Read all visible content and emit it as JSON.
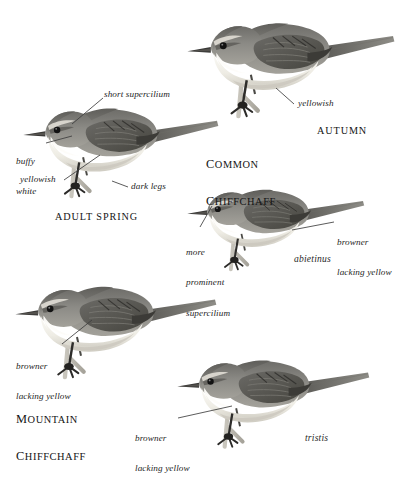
{
  "plate": {
    "kind": "bird-identification-plate",
    "background_color": "#ffffff",
    "ink_color": "#1e1e1e",
    "species_titles": [
      {
        "id": "common-chiffchaff",
        "line1": "Common",
        "line2": "Chiffchaff"
      },
      {
        "id": "mountain-chiffchaff",
        "line1": "Mountain",
        "line2": "Chiffchaff"
      }
    ],
    "plumage_titles": [
      {
        "id": "adult-spring",
        "text": "ADULT SPRING"
      },
      {
        "id": "autumn",
        "text": "AUTUMN"
      }
    ],
    "subspecies": [
      {
        "id": "abietinus",
        "text": "abietinus"
      },
      {
        "id": "tristis",
        "text": "tristis"
      }
    ],
    "figures": [
      {
        "id": "autumn-bird",
        "caption": "AUTUMN",
        "annotations": [
          {
            "id": "yellowish",
            "text": "yellowish"
          }
        ]
      },
      {
        "id": "adult-spring-bird",
        "caption": "ADULT SPRING",
        "annotations": [
          {
            "id": "short-supercilium",
            "text": "short supercilium"
          },
          {
            "id": "buffy-white",
            "text": "buffy\nwhite"
          },
          {
            "id": "yellowish",
            "text": "yellowish"
          },
          {
            "id": "dark-legs",
            "text": "dark legs"
          }
        ]
      },
      {
        "id": "abietinus-bird",
        "caption": "abietinus",
        "annotations": [
          {
            "id": "more-prominent-supercilium",
            "text": "more\nprominent\nsupercilium"
          },
          {
            "id": "browner-lacking-yellow",
            "text": "browner\nlacking yellow"
          }
        ]
      },
      {
        "id": "mountain-chiffchaff-bird",
        "caption": "MOUNTAIN CHIFFCHAFF",
        "annotations": [
          {
            "id": "browner-lacking-yellow",
            "text": "browner\nlacking yellow"
          }
        ]
      },
      {
        "id": "tristis-bird",
        "caption": "tristis",
        "annotations": [
          {
            "id": "browner-lacking-yellow",
            "text": "browner\nlacking yellow"
          }
        ]
      }
    ],
    "annotations": {
      "short_supercilium": "short supercilium",
      "buffy_white_l1": "buffy",
      "buffy_white_l2": "white",
      "yellowish": "yellowish",
      "dark_legs": "dark legs",
      "yellowish_autumn": "yellowish",
      "more": "more",
      "prominent": "prominent",
      "supercilium": "supercilium",
      "browner": "browner",
      "lacking_yellow": "lacking yellow",
      "browner_mtn": "browner",
      "lacking_yellow_mtn": "lacking yellow",
      "browner_tristis": "browner",
      "lacking_yellow_tristis": "lacking yellow"
    },
    "colors": {
      "upperparts": "#8d8c87",
      "upperparts_dark": "#5f5e5a",
      "crown": "#7b7a76",
      "underparts": "#efede6",
      "underparts_shade": "#d8d5cc",
      "wing_dark": "#4a4945",
      "bill": "#3a3937",
      "eye": "#141414",
      "leg": "#2e2d2b",
      "twig": "#b9b6ae"
    }
  }
}
